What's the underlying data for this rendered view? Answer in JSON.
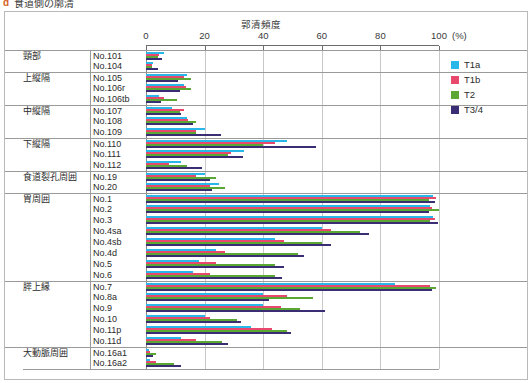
{
  "page_heading": {
    "bullet": "d",
    "text": "食道側の廓清"
  },
  "legend": {
    "items": [
      {
        "label": "T1a",
        "color": "#29b6e8"
      },
      {
        "label": "T1b",
        "color": "#e8486b"
      },
      {
        "label": "T2",
        "color": "#5ba733"
      },
      {
        "label": "T3/4",
        "color": "#3b2d73"
      }
    ]
  },
  "chart_data": {
    "type": "bar",
    "orientation": "horizontal",
    "title": "",
    "xlabel": "郭清頻度",
    "unit": "(%)",
    "ylabel": "",
    "xlim": [
      0,
      100
    ],
    "xticks": [
      0,
      20,
      40,
      60,
      80,
      100
    ],
    "grid": true,
    "legend_position": "right",
    "series": [
      {
        "name": "T1a",
        "color": "#29b6e8"
      },
      {
        "name": "T1b",
        "color": "#e8486b"
      },
      {
        "name": "T2",
        "color": "#5ba733"
      },
      {
        "name": "T3/4",
        "color": "#3b2d73"
      }
    ],
    "groups": [
      {
        "group": "頸部",
        "rows": [
          {
            "category": "No.101",
            "values": [
              6.0,
              4.5,
              4.0,
              5.5
            ]
          },
          {
            "category": "No.104",
            "values": [
              2.5,
              2.0,
              2.0,
              4.0
            ]
          }
        ]
      },
      {
        "group": "上縦隔",
        "rows": [
          {
            "category": "No.105",
            "values": [
              14.0,
              13.0,
              15.5,
              11.0
            ]
          },
          {
            "category": "No.106r",
            "values": [
              13.0,
              13.5,
              15.5,
              11.5
            ]
          },
          {
            "category": "No.106tb",
            "values": [
              4.5,
              6.0,
              10.5,
              5.0
            ]
          }
        ]
      },
      {
        "group": "中縦隔",
        "rows": [
          {
            "category": "No.107",
            "values": [
              9.0,
              13.0,
              11.5,
              12.0
            ]
          },
          {
            "category": "No.108",
            "values": [
              14.0,
              14.5,
              17.0,
              16.0
            ]
          },
          {
            "category": "No.109",
            "values": [
              20.0,
              17.0,
              17.0,
              25.5
            ]
          }
        ]
      },
      {
        "group": "下縦隔",
        "rows": [
          {
            "category": "No.110",
            "values": [
              48.0,
              44.0,
              40.0,
              58.0
            ]
          },
          {
            "category": "No.111",
            "values": [
              33.5,
              29.0,
              28.0,
              33.0
            ]
          },
          {
            "category": "No.112",
            "values": [
              12.0,
              8.0,
              14.0,
              19.0
            ]
          }
        ]
      },
      {
        "group": "食道裂孔周囲",
        "rows": [
          {
            "category": "No.19",
            "values": [
              20.0,
              17.0,
              24.0,
              22.0
            ]
          },
          {
            "category": "No.20",
            "values": [
              25.0,
              22.0,
              27.0,
              22.5
            ]
          }
        ]
      },
      {
        "group": "胃周囲",
        "rows": [
          {
            "category": "No.1",
            "values": [
              98.0,
              99.0,
              96.5,
              98.5
            ]
          },
          {
            "category": "No.2",
            "values": [
              97.0,
              97.5,
              100.0,
              96.5
            ]
          },
          {
            "category": "No.3",
            "values": [
              98.0,
              98.5,
              97.0,
              99.5
            ]
          },
          {
            "category": "No.4sa",
            "values": [
              60.0,
              63.0,
              73.0,
              76.0
            ]
          },
          {
            "category": "No.4sb",
            "values": [
              44.0,
              47.0,
              60.0,
              63.0
            ]
          },
          {
            "category": "No.4d",
            "values": [
              24.0,
              27.0,
              52.0,
              54.0
            ]
          },
          {
            "category": "No.5",
            "values": [
              18.0,
              24.0,
              44.0,
              47.0
            ]
          },
          {
            "category": "No.6",
            "values": [
              16.0,
              22.0,
              44.0,
              46.5
            ]
          }
        ]
      },
      {
        "group": "膵上縁",
        "rows": [
          {
            "category": "No.7",
            "values": [
              85.0,
              97.0,
              99.0,
              97.5
            ]
          },
          {
            "category": "No.8a",
            "values": [
              40.0,
              48.0,
              57.0,
              42.0
            ]
          },
          {
            "category": "No.9",
            "values": [
              40.0,
              46.0,
              52.5,
              61.0
            ]
          },
          {
            "category": "No.10",
            "values": [
              20.0,
              22.0,
              31.0,
              32.5
            ]
          },
          {
            "category": "No.11p",
            "values": [
              36.0,
              43.0,
              48.0,
              49.5
            ]
          },
          {
            "category": "No.11d",
            "values": [
              12.0,
              17.0,
              26.0,
              28.0
            ]
          }
        ]
      },
      {
        "group": "大動脈周囲",
        "rows": [
          {
            "category": "No.16a1",
            "values": [
              1.0,
              1.5,
              3.5,
              2.5
            ]
          },
          {
            "category": "No.16a2",
            "values": [
              1.5,
              3.5,
              9.5,
              12.0
            ]
          }
        ]
      }
    ]
  }
}
